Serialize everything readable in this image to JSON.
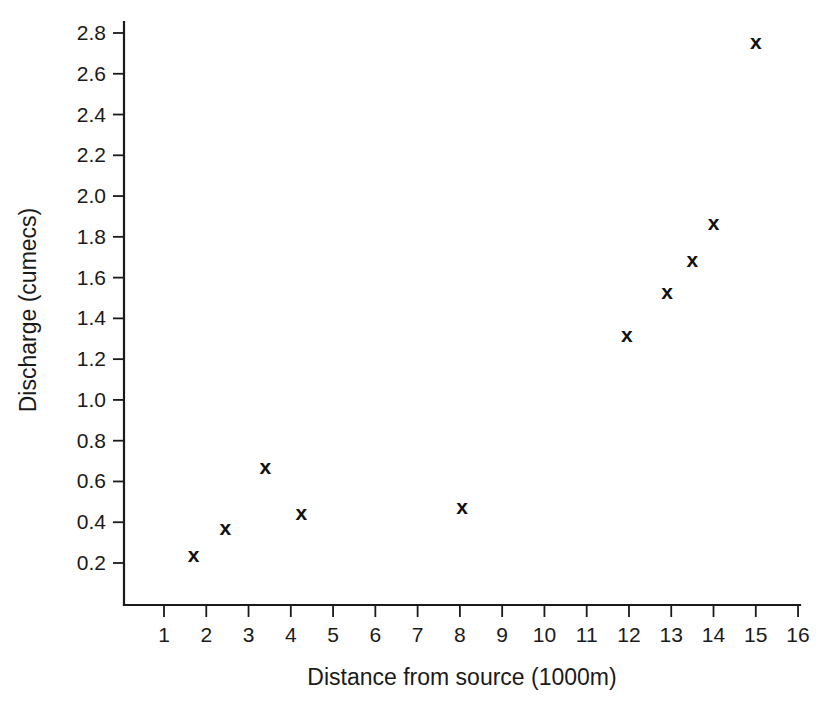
{
  "chart_data": {
    "type": "scatter",
    "title": "",
    "xlabel": "Distance from source (1000m)",
    "ylabel": "Discharge (cumecs)",
    "xlim": [
      0.35,
      16.4
    ],
    "ylim": [
      0.0,
      2.92
    ],
    "grid": false,
    "legend": null,
    "marker": "x",
    "marker_color": "#111111",
    "xticks": [
      1,
      2,
      3,
      4,
      5,
      6,
      7,
      8,
      9,
      10,
      11,
      12,
      13,
      14,
      15,
      16
    ],
    "xticklabels": [
      "1",
      "2",
      "3",
      "4",
      "5",
      "6",
      "7",
      "8",
      "9",
      "10",
      "11",
      "12",
      "13",
      "14",
      "15",
      "16"
    ],
    "yticks": [
      0.2,
      0.4,
      0.6,
      0.8,
      1.0,
      1.2,
      1.4,
      1.6,
      1.8,
      2.0,
      2.2,
      2.4,
      2.6,
      2.8
    ],
    "yticklabels": [
      "0.2",
      "0.4",
      "0.6",
      "0.8",
      "1.0",
      "1.2",
      "1.4",
      "1.6",
      "1.8",
      "2.0",
      "2.2",
      "2.4",
      "2.6",
      "2.8"
    ],
    "x": [
      1.7,
      2.45,
      3.4,
      4.25,
      8.05,
      11.95,
      12.9,
      13.5,
      14.0,
      15.0
    ],
    "y": [
      0.24,
      0.375,
      0.675,
      0.45,
      0.475,
      1.32,
      1.53,
      1.69,
      1.87,
      2.76
    ],
    "points": [
      {
        "x": 1.7,
        "y": 0.24
      },
      {
        "x": 2.45,
        "y": 0.375
      },
      {
        "x": 3.4,
        "y": 0.675
      },
      {
        "x": 4.25,
        "y": 0.45
      },
      {
        "x": 8.05,
        "y": 0.475
      },
      {
        "x": 11.95,
        "y": 1.32
      },
      {
        "x": 12.9,
        "y": 1.53
      },
      {
        "x": 13.5,
        "y": 1.69
      },
      {
        "x": 14.0,
        "y": 1.87
      },
      {
        "x": 15.0,
        "y": 2.76
      }
    ]
  },
  "axes": {
    "x_title": "Distance from source (1000m)",
    "y_title": "Discharge (cumecs)"
  }
}
